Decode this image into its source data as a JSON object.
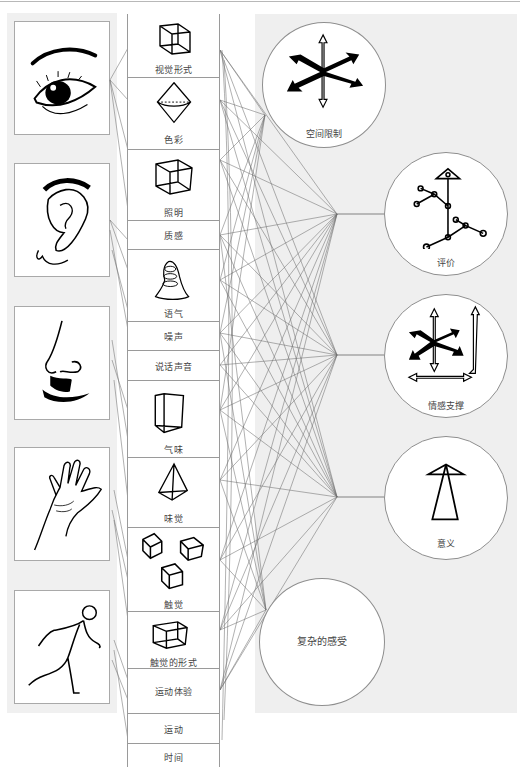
{
  "diagram": {
    "senses": [
      {
        "id": "eye",
        "icon": "eye-icon"
      },
      {
        "id": "ear",
        "icon": "ear-icon"
      },
      {
        "id": "nose-mouth",
        "icon": "nose-mouth-icon"
      },
      {
        "id": "hand",
        "icon": "hand-icon"
      },
      {
        "id": "body",
        "icon": "running-figure-icon"
      }
    ],
    "attributes": [
      {
        "label": "视觉形式",
        "icon": "cube-icon"
      },
      {
        "label": "色彩",
        "icon": "octahedron-icon"
      },
      {
        "label": "照明",
        "icon": "cube-icon"
      },
      {
        "label": "质感",
        "icon": null
      },
      {
        "label": "语气",
        "icon": "bell-icon"
      },
      {
        "label": "噪声",
        "icon": null
      },
      {
        "label": "说话声音",
        "icon": null
      },
      {
        "label": "气味",
        "icon": "prism-icon"
      },
      {
        "label": "味觉",
        "icon": "tetrahedron-icon"
      },
      {
        "label": "触觉",
        "icon": "three-cubes-icon"
      },
      {
        "label": "触觉的形式",
        "icon": "cube-icon"
      },
      {
        "label": "运动体验",
        "icon": null
      },
      {
        "label": "运动",
        "icon": null
      },
      {
        "label": "时间",
        "icon": null
      }
    ],
    "outcomes": [
      {
        "label": "空间限制",
        "icon": "axes-arrows-icon"
      },
      {
        "label": "评价",
        "icon": "node-tree-icon"
      },
      {
        "label": "情感支撑",
        "icon": "axes-arrows-frame-icon"
      },
      {
        "label": "意义",
        "icon": "arrow-up-icon"
      },
      {
        "label": "复杂的感受",
        "icon": null
      }
    ]
  }
}
